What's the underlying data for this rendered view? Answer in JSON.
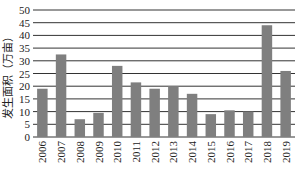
{
  "chart_data": {
    "type": "bar",
    "title": "",
    "xlabel": "",
    "ylabel": "发生面积（万亩）",
    "ylim": [
      0,
      50
    ],
    "yticks": [
      0,
      5,
      10,
      15,
      20,
      25,
      30,
      35,
      40,
      45,
      50
    ],
    "ytick_labels": [
      "0",
      "5",
      "10",
      "15",
      "20",
      "25",
      "30",
      "35",
      "40",
      "45",
      "50"
    ],
    "grid": true,
    "legend": "none",
    "categories": [
      "2006",
      "2007",
      "2008",
      "2009",
      "2010",
      "2011",
      "2012",
      "2013",
      "2014",
      "2015",
      "2016",
      "2017",
      "2018",
      "2019"
    ],
    "values": [
      19,
      32.5,
      7,
      9.5,
      28,
      21.5,
      19,
      20,
      17,
      9,
      10.5,
      10,
      44,
      26
    ],
    "bar_color": "#7f7f7f"
  }
}
